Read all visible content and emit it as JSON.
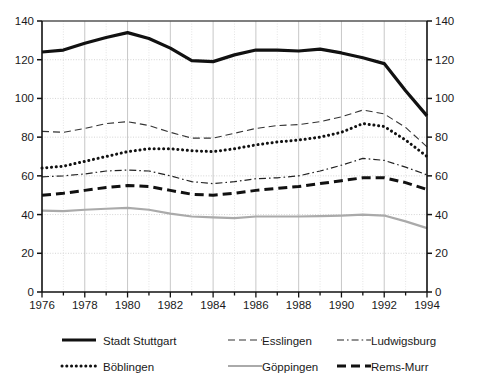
{
  "chart_data": {
    "type": "line",
    "title": "",
    "xlabel": "",
    "ylabel": "",
    "xlim": [
      1976,
      1994
    ],
    "ylim": [
      0,
      140
    ],
    "ytick_step": 20,
    "yticks": [
      0,
      20,
      40,
      60,
      80,
      100,
      120,
      140
    ],
    "xticks": [
      1976,
      1977,
      1978,
      1979,
      1980,
      1981,
      1982,
      1983,
      1984,
      1985,
      1986,
      1987,
      1988,
      1989,
      1990,
      1991,
      1992,
      1993,
      1994
    ],
    "xtick_labels": [
      "1976",
      "",
      "1978",
      "",
      "1980",
      "",
      "1982",
      "",
      "1984",
      "",
      "1986",
      "",
      "1988",
      "",
      "1990",
      "",
      "1992",
      "",
      "1994"
    ],
    "x": [
      1976,
      1977,
      1978,
      1979,
      1980,
      1981,
      1982,
      1983,
      1984,
      1985,
      1986,
      1987,
      1988,
      1989,
      1990,
      1991,
      1992,
      1993,
      1994
    ],
    "grid": true,
    "grid_axis": "both",
    "dual_y_axis": true,
    "legend_position": "bottom",
    "series": [
      {
        "name": "Stadt Stuttgart",
        "style": "solid",
        "color": "#111111",
        "width": 3.2,
        "values": [
          124,
          125,
          128.5,
          131.5,
          134,
          131,
          126,
          119.5,
          119,
          122.5,
          125,
          125,
          124.5,
          125.5,
          123.5,
          121,
          118,
          104,
          91
        ]
      },
      {
        "name": "Esslingen",
        "style": "dashed",
        "color": "#333333",
        "width": 1.1,
        "values": [
          83,
          82.5,
          84.5,
          87,
          88,
          86,
          82.5,
          79.5,
          79.5,
          82,
          84.5,
          86,
          86.5,
          88,
          90.5,
          94,
          92,
          85,
          75
        ]
      },
      {
        "name": "Ludwigsburg",
        "style": "dashdot",
        "color": "#222222",
        "width": 1.2,
        "values": [
          59.5,
          60,
          61,
          62.5,
          63,
          62.5,
          60,
          57,
          56,
          57,
          58.5,
          59,
          60,
          62.5,
          65.5,
          69,
          68,
          64.5,
          60.5
        ]
      },
      {
        "name": "Böblingen",
        "style": "dotted",
        "color": "#111111",
        "width": 3.0,
        "values": [
          64,
          65,
          67.5,
          70,
          72.5,
          74,
          74,
          73,
          72.5,
          74,
          76,
          77.5,
          78.5,
          80,
          82.5,
          87,
          85.5,
          78.5,
          70
        ]
      },
      {
        "name": "Göppingen",
        "style": "solid",
        "color": "#aaaaaa",
        "width": 2.2,
        "values": [
          42,
          41.8,
          42.5,
          43,
          43.5,
          42.5,
          40.5,
          39,
          38.5,
          38.2,
          39,
          39,
          39,
          39.2,
          39.5,
          40,
          39.5,
          36.5,
          33
        ]
      },
      {
        "name": "Rems-Murr",
        "style": "bigdash",
        "color": "#111111",
        "width": 3.0,
        "values": [
          50,
          51,
          52.5,
          54,
          55,
          54.5,
          52.5,
          50.5,
          50,
          51,
          52.5,
          53.5,
          54.5,
          56,
          57.5,
          59,
          59,
          56.5,
          53
        ]
      }
    ]
  },
  "axes": {
    "left_tick_labels": [
      "140",
      "120",
      "100",
      "80",
      "60",
      "40",
      "20",
      "0"
    ],
    "right_tick_labels": [
      "140",
      "120",
      "100",
      "80",
      "60",
      "40",
      "20",
      "0"
    ]
  },
  "legend": {
    "entries": [
      {
        "label": "Stadt Stuttgart",
        "style": "solid-thick"
      },
      {
        "label": "Esslingen",
        "style": "dashed-thin"
      },
      {
        "label": "Ludwigsburg",
        "style": "dash-dot"
      },
      {
        "label": "Böblingen",
        "style": "dotted-thick"
      },
      {
        "label": "Göppingen",
        "style": "solid-gray"
      },
      {
        "label": "Rems-Murr",
        "style": "bigdash-thick"
      }
    ]
  }
}
